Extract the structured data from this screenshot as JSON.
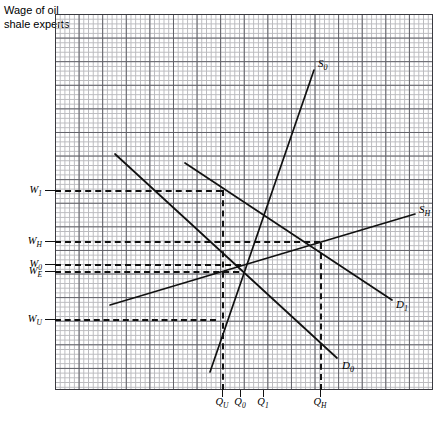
{
  "axis_title": "Wage of oil shale experts",
  "chart_data": {
    "type": "line",
    "title": "",
    "subtitle": "",
    "ylabel": "Wage of oil shale experts",
    "xlabel": "",
    "grid": true,
    "legend": "inline-curve-labels",
    "plot_box_px": {
      "left": 55,
      "top": 14,
      "right": 433,
      "bottom": 390
    },
    "y_axis": {
      "kind": "categorical-reference-levels",
      "ticks": [
        {
          "label": "W",
          "sub": "1",
          "y_px": 190
        },
        {
          "label": "W",
          "sub": "H",
          "y_px": 241
        },
        {
          "label": "W",
          "sub": "0",
          "y_px": 264
        },
        {
          "label": "W",
          "sub": "E",
          "y_px": 271
        },
        {
          "label": "W",
          "sub": "U",
          "y_px": 319
        }
      ]
    },
    "x_axis": {
      "kind": "categorical-reference-quantities",
      "ticks": [
        {
          "label": "Q",
          "sub": "U",
          "x_px": 222
        },
        {
          "label": "Q",
          "sub": "0",
          "x_px": 240
        },
        {
          "label": "Q",
          "sub": "1",
          "x_px": 263
        },
        {
          "label": "Q",
          "sub": "H",
          "x_px": 320
        }
      ]
    },
    "series": [
      {
        "name": "S",
        "sub": "0",
        "role": "supply",
        "label_x_px": 318,
        "label_y_px": 64,
        "points_px": [
          [
            210,
            372
          ],
          [
            314,
            70
          ]
        ]
      },
      {
        "name": "S",
        "sub": "H",
        "role": "supply",
        "label_x_px": 419,
        "label_y_px": 210,
        "points_px": [
          [
            110,
            305
          ],
          [
            415,
            214
          ]
        ]
      },
      {
        "name": "D",
        "sub": "0",
        "role": "demand",
        "label_x_px": 342,
        "label_y_px": 366,
        "points_px": [
          [
            115,
            154
          ],
          [
            337,
            358
          ]
        ]
      },
      {
        "name": "D",
        "sub": "1",
        "role": "demand",
        "label_x_px": 396,
        "label_y_px": 305,
        "points_px": [
          [
            185,
            163
          ],
          [
            392,
            300
          ]
        ]
      }
    ],
    "reference_lines": {
      "horizontal": [
        {
          "level": "W1",
          "y_px": 190,
          "x_from_px": 55,
          "x_to_px": 222
        },
        {
          "level": "WH",
          "y_px": 241,
          "x_from_px": 55,
          "x_to_px": 320
        },
        {
          "level": "W0",
          "y_px": 264,
          "x_from_px": 55,
          "x_to_px": 241
        },
        {
          "level": "WE",
          "y_px": 271,
          "x_from_px": 55,
          "x_to_px": 239
        },
        {
          "level": "WU",
          "y_px": 319,
          "x_from_px": 55,
          "x_to_px": 216
        }
      ],
      "vertical": [
        {
          "level": "QU",
          "x_px": 222,
          "y_from_px": 190,
          "y_to_px": 390
        },
        {
          "level": "QH",
          "x_px": 320,
          "y_from_px": 243,
          "y_to_px": 390
        }
      ]
    },
    "equilibrium_px": {
      "x": 239,
      "y": 270
    }
  },
  "curve_labels": [
    {
      "base": "S",
      "sub": "0"
    },
    {
      "base": "S",
      "sub": "H"
    },
    {
      "base": "D",
      "sub": "0"
    },
    {
      "base": "D",
      "sub": "1"
    }
  ],
  "y_labels": [
    {
      "base": "W",
      "sub": "1"
    },
    {
      "base": "W",
      "sub": "H"
    },
    {
      "base": "W",
      "sub": "0"
    },
    {
      "base": "W",
      "sub": "E"
    },
    {
      "base": "W",
      "sub": "U"
    }
  ],
  "x_labels": [
    {
      "base": "Q",
      "sub": "U"
    },
    {
      "base": "Q",
      "sub": "0"
    },
    {
      "base": "Q",
      "sub": "1"
    },
    {
      "base": "Q",
      "sub": "H"
    }
  ]
}
